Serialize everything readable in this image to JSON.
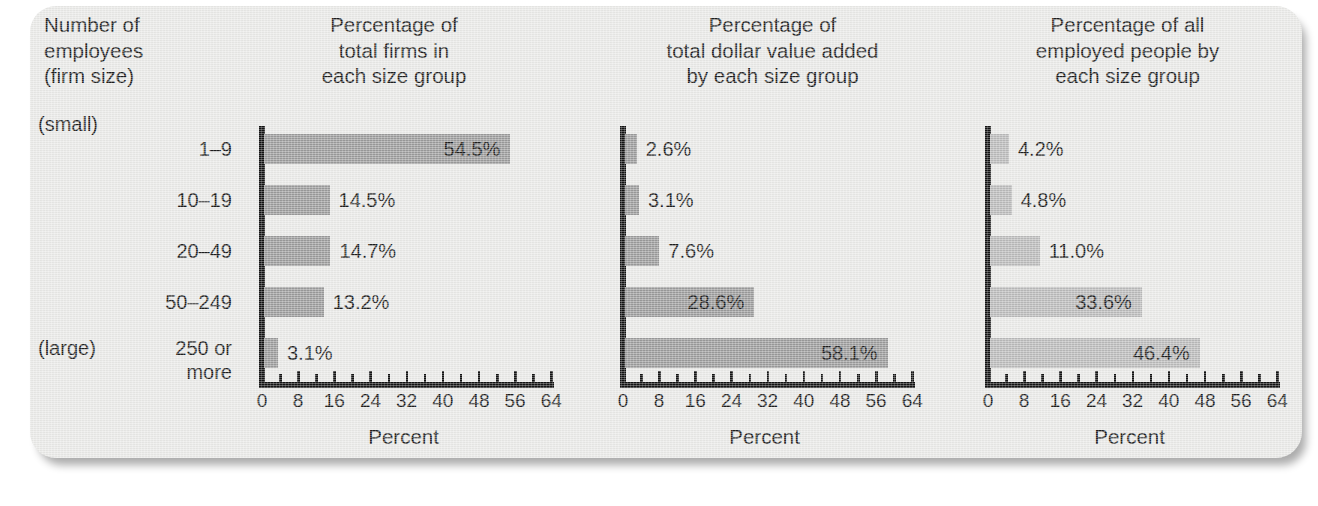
{
  "figure": {
    "background_color": "#e9e9e7",
    "row_header_title": "Number of\nemployees\n(firm size)",
    "small_note": "(small)",
    "large_note": "(large)",
    "axis_name": "Percent"
  },
  "chart_data": {
    "type": "bar",
    "orientation": "horizontal",
    "title": "",
    "categories": [
      "1–9",
      "10–19",
      "20–49",
      "50–249",
      "250 or\nmore"
    ],
    "category_axis_label": "Number of employees (firm size)",
    "xlabel": "Percent",
    "ylabel": "",
    "xlim": [
      0,
      64
    ],
    "xticks": [
      0,
      8,
      16,
      24,
      32,
      40,
      48,
      56,
      64
    ],
    "xtick_labels": [
      "0",
      "8",
      "16",
      "24",
      "32",
      "40",
      "48",
      "56",
      "64"
    ],
    "minor_tick_step": 4,
    "grid": false,
    "legend": null,
    "panels": [
      {
        "title": "Percentage of\ntotal firms in\neach size group",
        "bar_color": "#9a9a9a",
        "values": [
          54.5,
          14.5,
          14.7,
          13.2,
          3.1
        ],
        "value_labels": [
          "54.5%",
          "14.5%",
          "14.7%",
          "13.2%",
          "3.1%"
        ],
        "label_inside": [
          true,
          false,
          false,
          false,
          false
        ]
      },
      {
        "title": "Percentage of\ntotal dollar value added\nby each size group",
        "bar_color": "#9a9a9a",
        "values": [
          2.6,
          3.1,
          7.6,
          28.6,
          58.1
        ],
        "value_labels": [
          "2.6%",
          "3.1%",
          "7.6%",
          "28.6%",
          "58.1%"
        ],
        "label_inside": [
          false,
          false,
          false,
          true,
          true
        ]
      },
      {
        "title": "Percentage of all\nemployed people by\neach size group",
        "bar_color": "#b9b9b9",
        "values": [
          4.2,
          4.8,
          11.0,
          33.6,
          46.4
        ],
        "value_labels": [
          "4.2%",
          "4.8%",
          "11.0%",
          "33.6%",
          "46.4%"
        ],
        "label_inside": [
          false,
          false,
          false,
          true,
          true
        ]
      }
    ]
  }
}
